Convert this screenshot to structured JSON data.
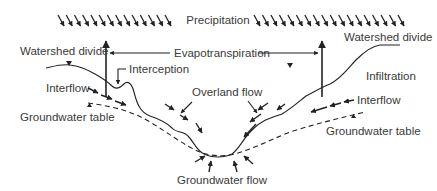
{
  "diagram": {
    "type": "hydrologic-cycle-cross-section",
    "labels": {
      "precipitation": "Precipitation",
      "evapotranspiration": "Evapotranspiration",
      "watershed_divide_left": "Watershed divide",
      "watershed_divide_right": "Watershed divide",
      "interception": "Interception",
      "infiltration": "Infiltration",
      "interflow_left": "Interflow",
      "interflow_right": "Interflow",
      "overland_flow": "Overland flow",
      "groundwater_table_left": "Groundwater table",
      "groundwater_table_right": "Groundwater table",
      "groundwater_flow": "Groundwater flow"
    },
    "precipitation_arrows": {
      "left_count": 14,
      "right_count": 18
    },
    "colors": {
      "ink": "#222222",
      "text": "#3a3a3a",
      "background": "#ffffff"
    }
  }
}
